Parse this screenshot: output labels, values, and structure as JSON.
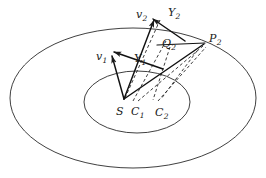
{
  "figure": {
    "type": "geometric-diagram",
    "background_color": "#ffffff",
    "stroke_color": "#1a1a1a",
    "labels": [
      {
        "id": "v2",
        "base": "v",
        "sub": "2",
        "x": 136,
        "y": 9
      },
      {
        "id": "Y2",
        "base": "Y",
        "sub": "2",
        "x": 168,
        "y": 7
      },
      {
        "id": "P2",
        "base": "P",
        "sub": "2",
        "x": 209,
        "y": 33
      },
      {
        "id": "Q2",
        "base": "Q",
        "sub": "2",
        "x": 162,
        "y": 38
      },
      {
        "id": "v1",
        "base": "v",
        "sub": "1",
        "x": 96,
        "y": 51
      },
      {
        "id": "Y1",
        "base": "Y",
        "sub": "1",
        "x": 134,
        "y": 53
      },
      {
        "id": "S",
        "base": "S",
        "sub": "",
        "x": 116,
        "y": 106
      },
      {
        "id": "C1",
        "base": "C",
        "sub": "1",
        "x": 131,
        "y": 106
      },
      {
        "id": "C2",
        "base": "C",
        "sub": "2",
        "x": 155,
        "y": 107
      }
    ],
    "ellipses": [
      {
        "id": "outer-ellipse",
        "cx": 133,
        "cy": 98,
        "rx": 123,
        "ry": 70
      },
      {
        "id": "inner-ellipse",
        "cx": 137,
        "cy": 102,
        "rx": 53,
        "ry": 31
      }
    ],
    "apex": {
      "id": "S",
      "x": 124,
      "y": 99
    },
    "solid_vectors": [
      {
        "id": "vector-v1",
        "x1": 124,
        "y1": 99,
        "x2": 110,
        "y2": 55
      },
      {
        "id": "vector-v2",
        "x1": 124,
        "y1": 99,
        "x2": 152,
        "y2": 18
      },
      {
        "id": "vector-S-P2",
        "x1": 124,
        "y1": 99,
        "x2": 205,
        "y2": 43
      },
      {
        "id": "vector-Y1",
        "x1": 162,
        "y1": 68,
        "x2": 115,
        "y2": 51
      },
      {
        "id": "vector-Y2",
        "x1": 184,
        "y1": 40,
        "x2": 152,
        "y2": 18
      },
      {
        "id": "segment-Q2-P2",
        "x1": 158,
        "y1": 44,
        "x2": 205,
        "y2": 43
      }
    ],
    "dashed_lines": [
      {
        "id": "dash-S-Y2-guide",
        "x1": 124,
        "y1": 99,
        "x2": 160,
        "y2": 20
      },
      {
        "id": "dash-C1-Q2",
        "x1": 133,
        "y1": 101,
        "x2": 166,
        "y2": 41
      },
      {
        "id": "dash-C1b-P2",
        "x1": 137,
        "y1": 101,
        "x2": 203,
        "y2": 45
      },
      {
        "id": "dash-C2-P2",
        "x1": 157,
        "y1": 101,
        "x2": 205,
        "y2": 46
      },
      {
        "id": "dash-Q2-down",
        "x1": 168,
        "y1": 46,
        "x2": 152,
        "y2": 100
      },
      {
        "id": "dash-P2-down",
        "x1": 196,
        "y1": 50,
        "x2": 160,
        "y2": 99
      }
    ]
  }
}
